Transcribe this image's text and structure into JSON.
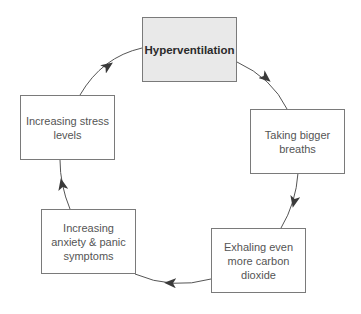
{
  "diagram": {
    "type": "cycle",
    "colors": {
      "highlight_fill": "#e9e9e9",
      "box_fill": "#ffffff",
      "border": "#7a7a7a",
      "arrow": "#444444",
      "text_primary": "#2b2b2b",
      "text_secondary": "#555555"
    },
    "nodes": [
      {
        "id": "hyperventilation",
        "label": "Hyperventilation",
        "highlight": true
      },
      {
        "id": "bigger-breaths",
        "label": "Taking bigger breaths",
        "highlight": false
      },
      {
        "id": "exhaling-co2",
        "label": "Exhaling even more carbon dioxide",
        "highlight": false
      },
      {
        "id": "anxiety-panic",
        "label": "Increasing anxiety & panic symptoms",
        "highlight": false
      },
      {
        "id": "stress-levels",
        "label": "Increasing stress levels",
        "highlight": false
      }
    ],
    "edges": [
      {
        "from": "hyperventilation",
        "to": "bigger-breaths"
      },
      {
        "from": "bigger-breaths",
        "to": "exhaling-co2"
      },
      {
        "from": "exhaling-co2",
        "to": "anxiety-panic"
      },
      {
        "from": "anxiety-panic",
        "to": "stress-levels"
      },
      {
        "from": "stress-levels",
        "to": "hyperventilation"
      }
    ]
  }
}
